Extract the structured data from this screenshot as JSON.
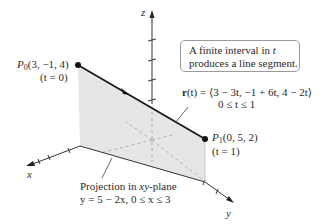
{
  "figure": {
    "type": "3d-parametric-line-segment",
    "axes": {
      "x_label": "x",
      "y_label": "y",
      "z_label": "z"
    },
    "points": {
      "p0": {
        "name": "P",
        "subscript": "0",
        "coords": "(3, −1, 4)",
        "param": "(t = 0)"
      },
      "p1": {
        "name": "P",
        "subscript": "1",
        "coords": "(0, 5, 2)",
        "param": "(t = 1)"
      }
    },
    "callout": {
      "line1_prefix": "A finite interval in ",
      "line1_var": "t",
      "line2": "produces a line segment."
    },
    "equation": {
      "lhs_bold": "r",
      "lhs_rest": "(t) = ⟨3 − 3t, −1 + 6t, 4 − 2t⟩",
      "domain": "0 ≤ t ≤ 1"
    },
    "projection": {
      "title_prefix": "Projection in ",
      "title_var": "xy",
      "title_suffix": "-plane",
      "equation": "y = 5 − 2x, 0 ≤ x ≤ 3"
    },
    "colors": {
      "plane_fill": "#e6e6e6",
      "line": "#1a1a1a",
      "axis": "#333333",
      "dashed": "#9a9a9a",
      "callout_border": "#9a9a9a"
    }
  }
}
